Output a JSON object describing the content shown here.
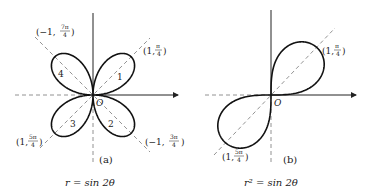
{
  "figures": [
    {
      "id": "a",
      "panel_label": "(a)",
      "equation": "r = sin 2θ",
      "origin_label": "O",
      "petal_numbers": [
        "1",
        "2",
        "3",
        "4"
      ],
      "point_labels": [
        {
          "name": "pi-over-4",
          "text": "(1, π/4)",
          "head": "(1, ",
          "num": "π",
          "den": "4",
          "tail": ")"
        },
        {
          "name": "7pi-over-4",
          "text": "(−1, 7π/4)",
          "head": "(−1, ",
          "num": "7π",
          "den": "4",
          "tail": ")"
        },
        {
          "name": "5pi-over-4",
          "text": "(1, 5π/4)",
          "head": "(1, ",
          "num": "5π",
          "den": "4",
          "tail": ")"
        },
        {
          "name": "3pi-over-4",
          "text": "(−1, 3π/4)",
          "head": "(−1, ",
          "num": "3π",
          "den": "4",
          "tail": ")"
        }
      ],
      "curve": {
        "type": "four-leaved rose",
        "petals": 4,
        "max_r": 1
      }
    },
    {
      "id": "b",
      "panel_label": "(b)",
      "equation": "r² = sin 2θ",
      "origin_label": "O",
      "point_labels": [
        {
          "name": "pi-over-4",
          "text": "(1, π/4)",
          "head": "(1, ",
          "num": "π",
          "den": "4",
          "tail": ")"
        },
        {
          "name": "5pi-over-4",
          "text": "(1, 5π/4)",
          "head": "(1, ",
          "num": "5π",
          "den": "4",
          "tail": ")"
        }
      ],
      "curve": {
        "type": "lemniscate",
        "lobes": 2,
        "max_r": 1
      }
    }
  ]
}
